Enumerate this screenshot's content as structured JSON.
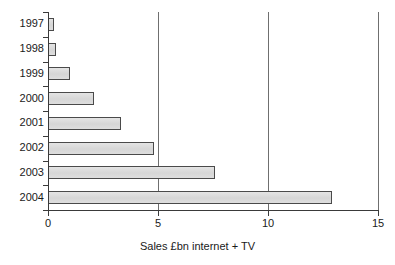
{
  "chart_data": {
    "type": "bar",
    "orientation": "horizontal",
    "title": "",
    "subtitle": "",
    "xlabel": "Sales £bn internet + TV",
    "ylabel": "",
    "categories": [
      "1997",
      "1998",
      "1999",
      "2000",
      "2001",
      "2002",
      "2003",
      "2004"
    ],
    "values": [
      0.25,
      0.35,
      1.0,
      2.1,
      3.3,
      4.8,
      7.6,
      12.9
    ],
    "series": [
      {
        "name": "Sales £bn internet + TV",
        "values": [
          0.25,
          0.35,
          1.0,
          2.1,
          3.3,
          4.8,
          7.6,
          12.9
        ]
      }
    ],
    "xlim": [
      0,
      15
    ],
    "xticks": [
      0,
      5,
      10,
      15
    ],
    "xtick_labels": [
      "0",
      "5",
      "10",
      "15"
    ],
    "grid": "vertical-gridlines-at-5-10-15",
    "legend": "none",
    "bar_fill_color": "#dcdcdc",
    "bar_border_color": "#4a4a4a",
    "axis_color": "#3a3a3a",
    "gridline_color": "#6f6f6f",
    "background_color": "#ffffff"
  }
}
